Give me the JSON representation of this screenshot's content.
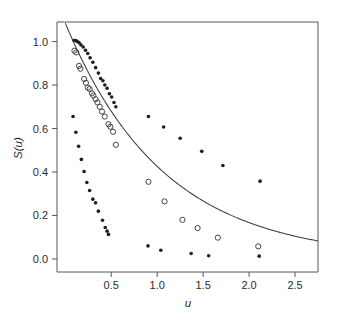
{
  "chart_data": {
    "type": "scatter",
    "title": "",
    "xlabel": "u",
    "ylabel": "S(u)",
    "xlim": [
      -0.09,
      2.75
    ],
    "ylim": [
      -0.06,
      1.09
    ],
    "grid": false,
    "legend": "none",
    "xticks": [
      0.5,
      1.0,
      1.5,
      2.0,
      2.5
    ],
    "xtick_labels": [
      "0.5",
      "1.0",
      "1.5",
      "2.0",
      "2.5"
    ],
    "yticks": [
      0.0,
      0.2,
      0.4,
      0.6,
      0.8,
      1.0
    ],
    "ytick_labels": [
      "0.0",
      "0.2",
      "0.4",
      "0.6",
      "0.8",
      "1.0"
    ],
    "series": [
      {
        "name": "upper-filled-branch",
        "marker": "filled-circle",
        "points": [
          [
            0.095,
            1.005
          ],
          [
            0.115,
            1.005
          ],
          [
            0.13,
            1.0
          ],
          [
            0.15,
            0.995
          ],
          [
            0.17,
            0.985
          ],
          [
            0.195,
            0.975
          ],
          [
            0.22,
            0.96
          ],
          [
            0.245,
            0.945
          ],
          [
            0.27,
            0.925
          ],
          [
            0.3,
            0.905
          ],
          [
            0.33,
            0.88
          ],
          [
            0.36,
            0.855
          ],
          [
            0.385,
            0.83
          ],
          [
            0.41,
            0.82
          ],
          [
            0.43,
            0.8
          ],
          [
            0.455,
            0.785
          ],
          [
            0.48,
            0.76
          ],
          [
            0.505,
            0.745
          ],
          [
            0.53,
            0.72
          ],
          [
            0.55,
            0.7
          ]
        ]
      },
      {
        "name": "lower-filled-branch",
        "marker": "filled-circle",
        "points": [
          [
            0.085,
            0.655
          ],
          [
            0.115,
            0.583
          ],
          [
            0.145,
            0.518
          ],
          [
            0.175,
            0.458
          ],
          [
            0.205,
            0.402
          ],
          [
            0.235,
            0.352
          ],
          [
            0.265,
            0.315
          ],
          [
            0.3,
            0.275
          ],
          [
            0.33,
            0.258
          ],
          [
            0.36,
            0.22
          ],
          [
            0.405,
            0.178
          ],
          [
            0.435,
            0.145
          ],
          [
            0.455,
            0.128
          ],
          [
            0.47,
            0.113
          ]
        ]
      },
      {
        "name": "scattered-filled-upper",
        "marker": "filled-circle",
        "points": [
          [
            0.905,
            0.655
          ],
          [
            1.07,
            0.607
          ],
          [
            1.25,
            0.555
          ],
          [
            1.485,
            0.495
          ],
          [
            1.715,
            0.43
          ],
          [
            2.12,
            0.358
          ]
        ]
      },
      {
        "name": "scattered-filled-lower",
        "marker": "filled-circle",
        "points": [
          [
            0.9,
            0.06
          ],
          [
            1.04,
            0.04
          ],
          [
            1.37,
            0.025
          ],
          [
            1.56,
            0.015
          ],
          [
            2.11,
            0.013
          ]
        ]
      },
      {
        "name": "open-circle-series",
        "marker": "open-circle",
        "points": [
          [
            0.1,
            0.958
          ],
          [
            0.12,
            0.95
          ],
          [
            0.15,
            0.888
          ],
          [
            0.165,
            0.875
          ],
          [
            0.205,
            0.828
          ],
          [
            0.225,
            0.81
          ],
          [
            0.245,
            0.788
          ],
          [
            0.265,
            0.782
          ],
          [
            0.29,
            0.762
          ],
          [
            0.305,
            0.752
          ],
          [
            0.33,
            0.735
          ],
          [
            0.35,
            0.72
          ],
          [
            0.375,
            0.7
          ],
          [
            0.4,
            0.678
          ],
          [
            0.43,
            0.655
          ],
          [
            0.47,
            0.62
          ],
          [
            0.49,
            0.608
          ],
          [
            0.52,
            0.585
          ],
          [
            0.55,
            0.525
          ],
          [
            0.905,
            0.355
          ],
          [
            1.08,
            0.265
          ],
          [
            1.275,
            0.18
          ],
          [
            1.44,
            0.142
          ],
          [
            1.66,
            0.098
          ],
          [
            2.1,
            0.058
          ]
        ]
      }
    ],
    "curve": {
      "name": "fitted-exponential-curve",
      "equation_form": "S(u) = A*exp(-k*u)",
      "A": 1.085,
      "k": 0.935,
      "u_start": 0.0,
      "u_end": 2.75
    }
  }
}
